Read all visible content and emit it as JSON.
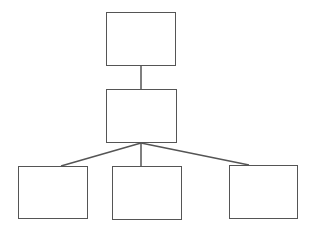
{
  "diagram": {
    "type": "hierarchy",
    "stroke_color": "#555555",
    "background": "#ffffff",
    "nodes": [
      {
        "id": "root",
        "label": "",
        "x": 106,
        "y": 12,
        "w": 70,
        "h": 54
      },
      {
        "id": "middle",
        "label": "",
        "x": 106,
        "y": 89,
        "w": 71,
        "h": 54
      },
      {
        "id": "child-left",
        "label": "",
        "x": 18,
        "y": 166,
        "w": 70,
        "h": 53
      },
      {
        "id": "child-center",
        "label": "",
        "x": 112,
        "y": 166,
        "w": 70,
        "h": 54
      },
      {
        "id": "child-right",
        "label": "",
        "x": 229,
        "y": 165,
        "w": 69,
        "h": 54
      }
    ],
    "edges": [
      {
        "from": "root",
        "to": "middle",
        "x1": 141,
        "y1": 66,
        "x2": 141,
        "y2": 89
      },
      {
        "from": "middle",
        "to": "child-left",
        "x1": 141,
        "y1": 143,
        "x2": 61,
        "y2": 166
      },
      {
        "from": "middle",
        "to": "child-center",
        "x1": 141,
        "y1": 143,
        "x2": 141,
        "y2": 166
      },
      {
        "from": "middle",
        "to": "child-right",
        "x1": 141,
        "y1": 143,
        "x2": 249,
        "y2": 165
      }
    ]
  }
}
